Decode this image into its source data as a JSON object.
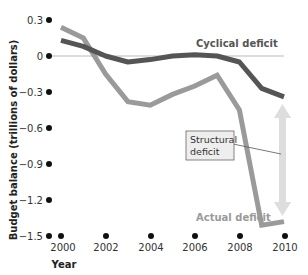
{
  "chart_data": {
    "type": "line",
    "title": "",
    "xlabel": "Year",
    "ylabel": "Budget balance (trillions of dollars)",
    "x": [
      2000,
      2001,
      2002,
      2003,
      2004,
      2005,
      2006,
      2007,
      2008,
      2009,
      2010
    ],
    "x_ticks": [
      "2000",
      "2002",
      "2004",
      "2006",
      "2008",
      "2010"
    ],
    "y_ticks": [
      "0.3",
      "0",
      "-0.3",
      "-0.6",
      "-0.9",
      "-1.2",
      "-1.5"
    ],
    "ylim": [
      -1.5,
      0.3
    ],
    "xlim": [
      2000,
      2010
    ],
    "grid": false,
    "series": [
      {
        "name": "Cyclical deficit",
        "color": "#555555",
        "values": [
          0.13,
          0.08,
          0.0,
          -0.05,
          -0.03,
          0.0,
          0.01,
          0.0,
          -0.05,
          -0.27,
          -0.34
        ]
      },
      {
        "name": "Actual deficit",
        "color": "#9a9a9a",
        "values": [
          0.24,
          0.15,
          -0.15,
          -0.38,
          -0.41,
          -0.32,
          -0.25,
          -0.16,
          -0.45,
          -1.41,
          -1.38
        ]
      }
    ],
    "annotations": [
      {
        "text": "Cyclical deficit",
        "target": "cyclical series"
      },
      {
        "text": "Actual deficit",
        "target": "actual series"
      },
      {
        "text": "Structural deficit",
        "target": "double arrow between cyclical and actual at 2010"
      }
    ]
  },
  "labels": {
    "cyclical": "Cyclical deficit",
    "actual": "Actual deficit",
    "structural_line1": "Structural",
    "structural_line2": "deficit",
    "ylabel": "Budget balance (trillions of dollars)",
    "xlabel": "Year",
    "yticks": [
      "0.3",
      "0",
      "−0.3",
      "−0.6",
      "−0.9",
      "−1.2",
      "−1.5"
    ],
    "xticks": [
      "2000",
      "2002",
      "2004",
      "2006",
      "2008",
      "2010"
    ]
  },
  "colors": {
    "cyclical": "#555555",
    "actual": "#9a9a9a",
    "zero_line": "#bbbbbb",
    "arrow": "#dddddd",
    "box_fill": "#eeeeee"
  }
}
